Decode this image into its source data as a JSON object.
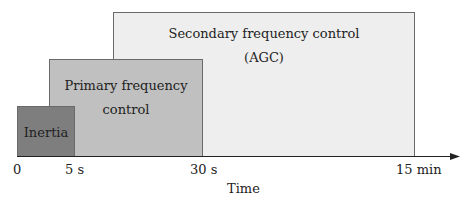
{
  "diagram": {
    "blocks": [
      {
        "id": "secondary",
        "lines": [
          "Secondary frequency control",
          "(AGC)"
        ],
        "fill": "#eeeeee"
      },
      {
        "id": "primary",
        "lines": [
          "Primary frequency",
          "control"
        ],
        "fill": "#c0c0c0"
      },
      {
        "id": "inertia",
        "lines": [
          "Inertia"
        ],
        "fill": "#7e7e7e"
      }
    ],
    "axis": {
      "label": "Time",
      "ticks": [
        "0",
        "5 s",
        "30 s",
        "15 min"
      ]
    }
  }
}
